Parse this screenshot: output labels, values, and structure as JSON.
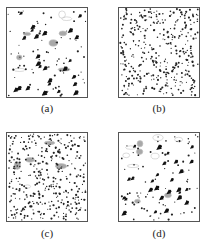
{
  "figure": {
    "panels": [
      {
        "id": "a",
        "label": "(a)",
        "box": {
          "x": 6,
          "y": 7,
          "w": 82,
          "h": 91
        },
        "caption_pos": {
          "x": 27,
          "y": 102
        },
        "small_dots": 70,
        "large_particles": 26,
        "gray_blobs": 8,
        "seed": 11
      },
      {
        "id": "b",
        "label": "(b)",
        "box": {
          "x": 118,
          "y": 7,
          "w": 82,
          "h": 91
        },
        "caption_pos": {
          "x": 139,
          "y": 102
        },
        "small_dots": 380,
        "large_particles": 0,
        "gray_blobs": 0,
        "seed": 23
      },
      {
        "id": "c",
        "label": "(c)",
        "box": {
          "x": 6,
          "y": 132,
          "w": 82,
          "h": 90
        },
        "caption_pos": {
          "x": 27,
          "y": 227
        },
        "small_dots": 360,
        "large_particles": 0,
        "gray_blobs": 5,
        "seed": 37
      },
      {
        "id": "d",
        "label": "(d)",
        "box": {
          "x": 118,
          "y": 132,
          "w": 82,
          "h": 90
        },
        "caption_pos": {
          "x": 139,
          "y": 227
        },
        "small_dots": 80,
        "large_particles": 26,
        "gray_blobs": 10,
        "seed": 53
      }
    ],
    "colors": {
      "dot": "#222222",
      "large": "#111111",
      "blob": "#9a9a9a",
      "blob_outline": "#b8b8b8",
      "border": "#555555"
    }
  }
}
